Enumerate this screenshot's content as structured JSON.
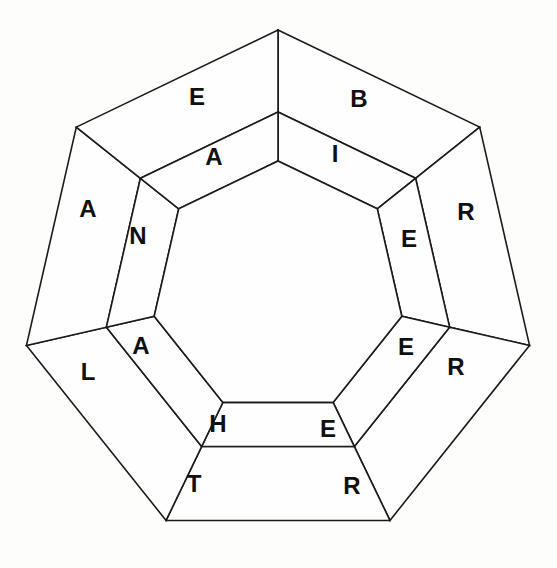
{
  "puzzle": {
    "title": "Nested Heptagon Word Wheel",
    "shape": "heptagon",
    "sides": 7,
    "ring_count": 2,
    "background_color": "#fdfdfc",
    "line_color": "#1a1a1a",
    "letter_color": "#101010",
    "center": {
      "x": 278,
      "y": 288
    },
    "radii": {
      "outer": 258,
      "middle": 176,
      "inner": 127
    },
    "rotation_degrees": 0,
    "outer_ring": {
      "name": "outer-ring",
      "letters": [
        "B",
        "R",
        "R",
        "R",
        "T",
        "L",
        "A",
        "E"
      ],
      "cells": [
        {
          "index": 0,
          "letter": "E",
          "x": 197,
          "y": 96
        },
        {
          "index": 1,
          "letter": "B",
          "x": 359,
          "y": 98
        },
        {
          "index": 2,
          "letter": "R",
          "x": 466,
          "y": 211
        },
        {
          "index": 3,
          "letter": "R",
          "x": 456,
          "y": 366
        },
        {
          "index": 4,
          "letter": "R",
          "x": 352,
          "y": 485
        },
        {
          "index": 5,
          "letter": "T",
          "x": 194,
          "y": 483
        },
        {
          "index": 6,
          "letter": "L",
          "x": 88,
          "y": 371
        },
        {
          "index": 7,
          "letter": "A",
          "x": 88,
          "y": 208
        }
      ]
    },
    "inner_ring": {
      "name": "inner-ring",
      "letters": [
        "A",
        "I",
        "E",
        "E",
        "E",
        "H",
        "A",
        "N"
      ],
      "cells": [
        {
          "index": 0,
          "letter": "A",
          "x": 214,
          "y": 156
        },
        {
          "index": 1,
          "letter": "I",
          "x": 335,
          "y": 153
        },
        {
          "index": 2,
          "letter": "E",
          "x": 409,
          "y": 238
        },
        {
          "index": 3,
          "letter": "E",
          "x": 406,
          "y": 346
        },
        {
          "index": 4,
          "letter": "E",
          "x": 328,
          "y": 428
        },
        {
          "index": 5,
          "letter": "H",
          "x": 218,
          "y": 423
        },
        {
          "index": 6,
          "letter": "A",
          "x": 141,
          "y": 345
        },
        {
          "index": 7,
          "letter": "N",
          "x": 138,
          "y": 235
        }
      ]
    },
    "hub": {
      "name": "center-hub",
      "label": "",
      "filled": false
    }
  }
}
